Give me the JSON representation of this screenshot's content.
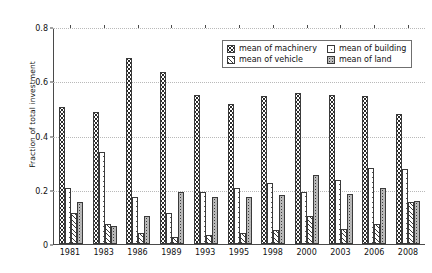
{
  "chart_data": {
    "type": "bar",
    "title": "",
    "xlabel": "",
    "ylabel": "Fraction of total investment",
    "ylim": [
      0,
      0.8
    ],
    "yticks": [
      "0",
      "0.2",
      "0.4",
      "0.6",
      "0.8"
    ],
    "ytick_values": [
      0,
      0.2,
      0.4,
      0.6,
      0.8
    ],
    "grid": true,
    "legend_position": "upper right",
    "categories": [
      "1981",
      "1983",
      "1986",
      "1989",
      "1993",
      "1995",
      "1998",
      "2000",
      "2003",
      "2006",
      "2008"
    ],
    "series": [
      {
        "name": "mean of machinery",
        "pattern": "coarse-dots",
        "values": [
          0.505,
          0.485,
          0.685,
          0.635,
          0.55,
          0.515,
          0.545,
          0.555,
          0.55,
          0.545,
          0.48
        ]
      },
      {
        "name": "mean of building",
        "pattern": "plain",
        "values": [
          0.205,
          0.34,
          0.175,
          0.115,
          0.19,
          0.205,
          0.225,
          0.19,
          0.235,
          0.28,
          0.275
        ]
      },
      {
        "name": "mean of vehicle",
        "pattern": "diagonal-hatch",
        "values": [
          0.115,
          0.075,
          0.04,
          0.025,
          0.035,
          0.04,
          0.05,
          0.105,
          0.055,
          0.075,
          0.155
        ]
      },
      {
        "name": "mean of land",
        "pattern": "fine-dots",
        "values": [
          0.155,
          0.065,
          0.105,
          0.19,
          0.175,
          0.175,
          0.18,
          0.255,
          0.185,
          0.205,
          0.16
        ]
      }
    ]
  },
  "legend": {
    "entries": [
      {
        "label": "mean of machinery",
        "icon": "swatch-machinery-icon"
      },
      {
        "label": "mean of building",
        "icon": "swatch-building-icon"
      },
      {
        "label": "mean of vehicle",
        "icon": "swatch-vehicle-icon"
      },
      {
        "label": "mean of land",
        "icon": "swatch-land-icon"
      }
    ]
  },
  "axes": {
    "ylabel": "Fraction of total investment"
  }
}
